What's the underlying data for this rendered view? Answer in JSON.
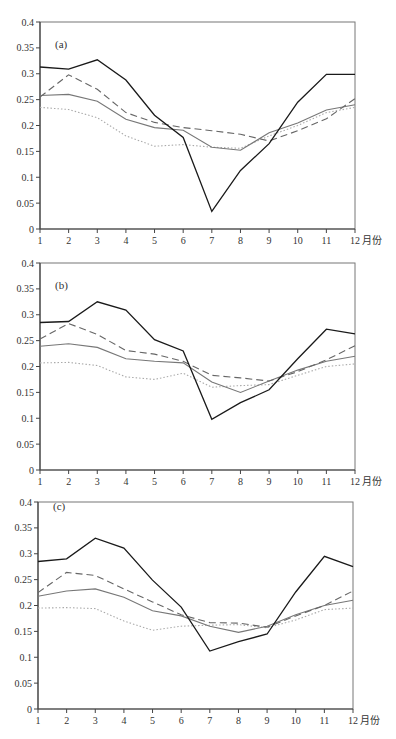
{
  "chart_data": [
    {
      "type": "line",
      "panel_label": "(a)",
      "xlabel": "月份",
      "ylabel": "",
      "x": [
        1,
        2,
        3,
        4,
        5,
        6,
        7,
        8,
        9,
        10,
        11,
        12
      ],
      "x_tick_labels": [
        "1",
        "2",
        "3",
        "4",
        "5",
        "6",
        "7",
        "8",
        "9",
        "10",
        "11",
        "12"
      ],
      "ylim": [
        0,
        0.4
      ],
      "y_ticks": [
        0,
        0.05,
        0.1,
        0.15,
        0.2,
        0.25,
        0.3,
        0.35,
        0.4
      ],
      "y_tick_labels": [
        "0",
        "0.05",
        "0.1",
        "0.15",
        "0.2",
        "0.25",
        "0.3",
        "0.35",
        "0.4"
      ],
      "grid": false,
      "legend": null,
      "series": [
        {
          "name": "black-solid",
          "style": "solid",
          "color": "#1a1a1a",
          "values": [
            0.313,
            0.309,
            0.327,
            0.288,
            0.22,
            0.177,
            0.034,
            0.113,
            0.165,
            0.245,
            0.299,
            0.299
          ]
        },
        {
          "name": "gray-dashed",
          "style": "dashed",
          "color": "#666666",
          "values": [
            0.255,
            0.298,
            0.27,
            0.225,
            0.206,
            0.196,
            0.19,
            0.183,
            0.17,
            0.19,
            0.213,
            0.252
          ]
        },
        {
          "name": "gray-solid",
          "style": "solid",
          "color": "#777777",
          "values": [
            0.258,
            0.26,
            0.247,
            0.212,
            0.196,
            0.191,
            0.158,
            0.152,
            0.186,
            0.205,
            0.23,
            0.24
          ]
        },
        {
          "name": "light-dotted",
          "style": "dotted",
          "color": "#aaaaaa",
          "values": [
            0.235,
            0.231,
            0.215,
            0.18,
            0.16,
            0.163,
            0.158,
            0.156,
            0.18,
            0.2,
            0.225,
            0.235
          ]
        }
      ]
    },
    {
      "type": "line",
      "panel_label": "(b)",
      "xlabel": "月份",
      "ylabel": "",
      "x": [
        1,
        2,
        3,
        4,
        5,
        6,
        7,
        8,
        9,
        10,
        11,
        12
      ],
      "x_tick_labels": [
        "1",
        "2",
        "3",
        "4",
        "5",
        "6",
        "7",
        "8",
        "9",
        "10",
        "11",
        "12"
      ],
      "ylim": [
        0,
        0.4
      ],
      "y_ticks": [
        0,
        0.05,
        0.1,
        0.15,
        0.2,
        0.25,
        0.3,
        0.35,
        0.4
      ],
      "y_tick_labels": [
        "0",
        "0.05",
        "0.1",
        "0.15",
        "0.2",
        "0.25",
        "0.3",
        "0.35",
        "0.4"
      ],
      "grid": false,
      "legend": null,
      "series": [
        {
          "name": "black-solid",
          "style": "solid",
          "color": "#1a1a1a",
          "values": [
            0.285,
            0.287,
            0.325,
            0.309,
            0.252,
            0.23,
            0.098,
            0.13,
            0.155,
            0.215,
            0.272,
            0.263
          ]
        },
        {
          "name": "gray-dashed",
          "style": "dashed",
          "color": "#666666",
          "values": [
            0.253,
            0.283,
            0.262,
            0.231,
            0.224,
            0.21,
            0.183,
            0.178,
            0.172,
            0.19,
            0.213,
            0.24
          ]
        },
        {
          "name": "gray-solid",
          "style": "solid",
          "color": "#777777",
          "values": [
            0.239,
            0.244,
            0.237,
            0.215,
            0.21,
            0.207,
            0.17,
            0.15,
            0.172,
            0.193,
            0.21,
            0.22
          ]
        },
        {
          "name": "light-dotted",
          "style": "dotted",
          "color": "#aaaaaa",
          "values": [
            0.207,
            0.208,
            0.202,
            0.18,
            0.175,
            0.187,
            0.16,
            0.163,
            0.165,
            0.183,
            0.2,
            0.205
          ]
        }
      ]
    },
    {
      "type": "line",
      "panel_label": "(c)",
      "xlabel": "月份",
      "ylabel": "",
      "x": [
        1,
        2,
        3,
        4,
        5,
        6,
        7,
        8,
        9,
        10,
        11,
        12
      ],
      "x_tick_labels": [
        "1",
        "2",
        "3",
        "4",
        "5",
        "6",
        "7",
        "8",
        "9",
        "10",
        "11",
        "12"
      ],
      "ylim": [
        0,
        0.4
      ],
      "y_ticks": [
        0,
        0.05,
        0.1,
        0.15,
        0.2,
        0.25,
        0.3,
        0.35,
        0.4
      ],
      "y_tick_labels": [
        "0",
        "0.05",
        "0.1",
        "0.15",
        "0.2",
        "0.25",
        "0.3",
        "0.35",
        "0.4"
      ],
      "grid": false,
      "legend": null,
      "series": [
        {
          "name": "black-solid",
          "style": "solid",
          "color": "#1a1a1a",
          "values": [
            0.285,
            0.29,
            0.33,
            0.311,
            0.249,
            0.197,
            0.112,
            0.13,
            0.145,
            0.226,
            0.295,
            0.275
          ]
        },
        {
          "name": "gray-dashed",
          "style": "dashed",
          "color": "#666666",
          "values": [
            0.225,
            0.264,
            0.258,
            0.232,
            0.207,
            0.182,
            0.167,
            0.166,
            0.158,
            0.18,
            0.2,
            0.228
          ]
        },
        {
          "name": "gray-solid",
          "style": "solid",
          "color": "#777777",
          "values": [
            0.218,
            0.228,
            0.232,
            0.216,
            0.19,
            0.18,
            0.16,
            0.148,
            0.16,
            0.182,
            0.2,
            0.21
          ]
        },
        {
          "name": "light-dotted",
          "style": "dotted",
          "color": "#aaaaaa",
          "values": [
            0.195,
            0.196,
            0.194,
            0.17,
            0.152,
            0.16,
            0.162,
            0.163,
            0.157,
            0.172,
            0.192,
            0.195
          ]
        }
      ]
    }
  ],
  "layout": {
    "panels": [
      {
        "x_left": 40,
        "x_right": 355,
        "y_top": 22,
        "y_bottom": 229
      },
      {
        "x_left": 40,
        "x_right": 355,
        "y_top": 263,
        "y_bottom": 470
      },
      {
        "x_left": 38,
        "x_right": 353,
        "y_top": 502,
        "y_bottom": 709
      }
    ]
  }
}
